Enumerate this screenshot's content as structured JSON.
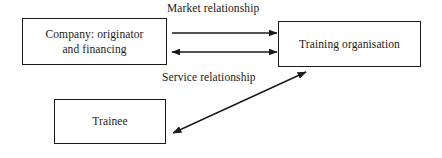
{
  "diagram": {
    "canvas": {
      "width": 442,
      "height": 158
    },
    "colors": {
      "background": "#ffffff",
      "stroke": "#1a1a1a",
      "text": "#1a1a1a"
    },
    "nodes": [
      {
        "id": "company",
        "label": "Company: originator\nand financing",
        "shape": "rectangle"
      },
      {
        "id": "training",
        "label": "Training organisation",
        "shape": "rectangle"
      },
      {
        "id": "trainee",
        "label": "Trainee",
        "shape": "rectangle"
      }
    ],
    "edges": [
      {
        "id": "market-top",
        "label": "Market relationship",
        "from": "company",
        "to": "training",
        "arrowheads": "end"
      },
      {
        "id": "market-bottom",
        "label": "",
        "from": "company",
        "to": "training",
        "arrowheads": "both"
      },
      {
        "id": "service",
        "label": "Service relationship",
        "from": "trainee",
        "to": "training",
        "arrowheads": "both"
      }
    ]
  }
}
